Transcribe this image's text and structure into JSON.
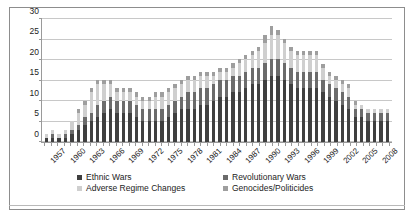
{
  "chart_data": {
    "type": "bar",
    "stacked": true,
    "title": "",
    "subtitle": "",
    "xlabel": "",
    "ylabel": "",
    "ylim": [
      0,
      30
    ],
    "ytick_values": [
      0,
      5,
      10,
      15,
      20,
      25,
      30
    ],
    "ytick_labels": [
      "0",
      "5",
      "10",
      "15",
      "20",
      "25",
      "30"
    ],
    "grid": true,
    "grid_axis": "y",
    "legend_position": "bottom",
    "categories": [
      "1957",
      "1958",
      "1959",
      "1960",
      "1961",
      "1962",
      "1963",
      "1964",
      "1965",
      "1966",
      "1967",
      "1968",
      "1969",
      "1970",
      "1971",
      "1972",
      "1973",
      "1974",
      "1975",
      "1976",
      "1977",
      "1978",
      "1979",
      "1980",
      "1981",
      "1982",
      "1983",
      "1984",
      "1985",
      "1986",
      "1987",
      "1988",
      "1989",
      "1990",
      "1991",
      "1992",
      "1993",
      "1994",
      "1995",
      "1996",
      "1997",
      "1998",
      "1999",
      "2000",
      "2001",
      "2002",
      "2003",
      "2004",
      "2005",
      "2006",
      "2007",
      "2008",
      "2009",
      "2010"
    ],
    "xtick_labels": [
      "1957",
      "1960",
      "1963",
      "1966",
      "1969",
      "1972",
      "1975",
      "1978",
      "1981",
      "1984",
      "1987",
      "1990",
      "1993",
      "1996",
      "1999",
      "2002",
      "2005",
      "2008"
    ],
    "xtick_interval": 3,
    "series": [
      {
        "name": "Ethnic Wars",
        "color": "#3f3f3f",
        "values": [
          1,
          1,
          1,
          1,
          2,
          3,
          4,
          5,
          6,
          7,
          8,
          7,
          7,
          7,
          6,
          5,
          5,
          5,
          5,
          6,
          7,
          8,
          8,
          8,
          9,
          9,
          10,
          11,
          11,
          12,
          12,
          13,
          14,
          14,
          15,
          16,
          16,
          15,
          14,
          13,
          13,
          13,
          13,
          12,
          11,
          10,
          9,
          8,
          6,
          6,
          5,
          5,
          5,
          5
        ]
      },
      {
        "name": "Revolutionary Wars",
        "color": "#6b6b6b",
        "values": [
          0,
          1,
          0,
          1,
          1,
          1,
          2,
          2,
          3,
          3,
          3,
          3,
          3,
          3,
          3,
          3,
          3,
          3,
          3,
          3,
          3,
          3,
          4,
          4,
          4,
          4,
          4,
          4,
          4,
          4,
          4,
          4,
          4,
          4,
          4,
          4,
          4,
          4,
          4,
          4,
          4,
          4,
          4,
          3,
          3,
          3,
          3,
          3,
          2,
          2,
          2,
          2,
          2,
          2
        ]
      },
      {
        "name": "Adverse Regime Changes",
        "color": "#cfcfcf",
        "values": [
          1,
          1,
          1,
          1,
          2,
          3,
          3,
          5,
          5,
          4,
          3,
          2,
          2,
          2,
          2,
          2,
          2,
          3,
          3,
          3,
          3,
          3,
          3,
          3,
          3,
          3,
          2,
          2,
          2,
          2,
          3,
          3,
          3,
          4,
          5,
          6,
          6,
          5,
          4,
          4,
          4,
          4,
          4,
          3,
          2,
          2,
          2,
          2,
          1,
          1,
          1,
          1,
          1,
          1
        ]
      },
      {
        "name": "Genocides/Politicides",
        "color": "#9e9e9e",
        "values": [
          0,
          0,
          0,
          0,
          0,
          1,
          1,
          1,
          1,
          1,
          1,
          1,
          1,
          1,
          1,
          1,
          1,
          1,
          1,
          1,
          1,
          1,
          1,
          1,
          1,
          1,
          1,
          1,
          1,
          1,
          1,
          1,
          1,
          1,
          2,
          2,
          1,
          1,
          1,
          1,
          1,
          1,
          1,
          1,
          1,
          1,
          1,
          1,
          1,
          0,
          0,
          0,
          0,
          0
        ]
      }
    ]
  },
  "legend": {
    "items": [
      {
        "label": "Ethnic Wars",
        "swatch": "s0"
      },
      {
        "label": "Revolutionary Wars",
        "swatch": "s1"
      },
      {
        "label": "Adverse Regime Changes",
        "swatch": "s2"
      },
      {
        "label": "Genocides/Politicides",
        "swatch": "s3"
      }
    ]
  }
}
